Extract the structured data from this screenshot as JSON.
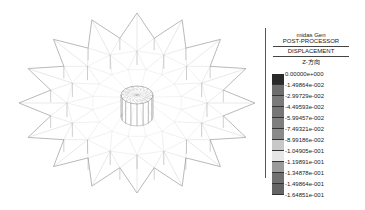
{
  "model_view": {
    "description": "3D wireframe of star-shaped spatial truss structure with central cylindrical hub",
    "star_points": 16
  },
  "legend": {
    "software": "midas Gen",
    "module": "POST-PROCESSOR",
    "result_type": "DISPLACEMENT",
    "component": "Z-方向",
    "levels": [
      {
        "value": "0.00000e+000",
        "color": "#2a2a2a"
      },
      {
        "value": "-1.49864e-002",
        "color": "#6e6e6e"
      },
      {
        "value": "-2.99729e-002",
        "color": "#7a7a7a"
      },
      {
        "value": "-4.49593e-002",
        "color": "#767676"
      },
      {
        "value": "-5.99457e-002",
        "color": "#7e7e7e"
      },
      {
        "value": "-7.49321e-002",
        "color": "#8a8a8a"
      },
      {
        "value": "-8.99186e-002",
        "color": "#c8c8c8"
      },
      {
        "value": "-1.04905e-001",
        "color": "#e6e6e6"
      },
      {
        "value": "-1.19891e-001",
        "color": "#9a9a9a"
      },
      {
        "value": "-1.34878e-001",
        "color": "#707070"
      },
      {
        "value": "-1.49864e-001",
        "color": "#646464"
      },
      {
        "value": "-1.64851e-001",
        "color": null
      }
    ]
  }
}
